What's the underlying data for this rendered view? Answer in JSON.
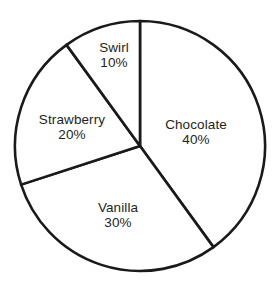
{
  "chart_data": {
    "type": "pie",
    "title": "",
    "subtitle": "",
    "xlabel": "",
    "ylabel": "",
    "legend": "none",
    "grid": false,
    "units": "percent",
    "start_angle_deg": 0,
    "direction": "clockwise",
    "center": {
      "x": 140,
      "y": 146
    },
    "radius": 125,
    "stroke_color": "#1a1a1a",
    "stroke_width": 2.6,
    "slice_fill": "#ffffff",
    "label_color": "#231f20",
    "categories": [
      "Chocolate",
      "Vanilla",
      "Strawberry",
      "Swirl"
    ],
    "values": [
      40,
      30,
      20,
      10
    ],
    "slices": [
      {
        "name": "Chocolate",
        "value": 40,
        "value_label": "40%",
        "start_deg": 0,
        "end_deg": 144,
        "label_x": 196,
        "label_y": 132
      },
      {
        "name": "Vanilla",
        "value": 30,
        "value_label": "30%",
        "start_deg": 144,
        "end_deg": 252,
        "label_x": 118,
        "label_y": 215
      },
      {
        "name": "Strawberry",
        "value": 20,
        "value_label": "20%",
        "start_deg": 252,
        "end_deg": 324,
        "label_x": 72,
        "label_y": 127
      },
      {
        "name": "Swirl",
        "value": 10,
        "value_label": "10%",
        "start_deg": 324,
        "end_deg": 360,
        "label_x": 114,
        "label_y": 55
      }
    ]
  }
}
